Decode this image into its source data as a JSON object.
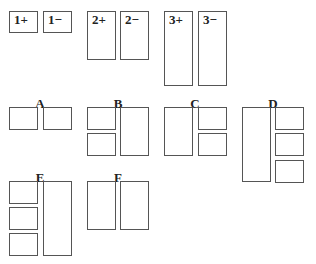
{
  "pieces": [
    {
      "id": "1+",
      "label": "1+",
      "x": 9,
      "y": 11,
      "w": 29,
      "h": 22
    },
    {
      "id": "1-",
      "label": "1−",
      "x": 43,
      "y": 11,
      "w": 29,
      "h": 22
    },
    {
      "id": "2+",
      "label": "2+",
      "x": 87,
      "y": 11,
      "w": 29,
      "h": 49
    },
    {
      "id": "2-",
      "label": "2−",
      "x": 120,
      "y": 11,
      "w": 29,
      "h": 49
    },
    {
      "id": "3+",
      "label": "3+",
      "x": 164,
      "y": 11,
      "w": 29,
      "h": 75
    },
    {
      "id": "3-",
      "label": "3−",
      "x": 198,
      "y": 11,
      "w": 29,
      "h": 75
    }
  ],
  "arrangements": [
    {
      "label": "A",
      "label_x": 30,
      "label_y": 97,
      "boxes": [
        {
          "x": 9,
          "y": 107,
          "w": 29,
          "h": 23
        },
        {
          "x": 43,
          "y": 107,
          "w": 29,
          "h": 23
        }
      ]
    },
    {
      "label": "B",
      "label_x": 108,
      "label_y": 97,
      "boxes": [
        {
          "x": 87,
          "y": 107,
          "w": 29,
          "h": 23
        },
        {
          "x": 87,
          "y": 133,
          "w": 29,
          "h": 23
        },
        {
          "x": 120,
          "y": 107,
          "w": 29,
          "h": 49
        }
      ]
    },
    {
      "label": "C",
      "label_x": 185,
      "label_y": 97,
      "boxes": [
        {
          "x": 164,
          "y": 107,
          "w": 29,
          "h": 49
        },
        {
          "x": 198,
          "y": 107,
          "w": 29,
          "h": 23
        },
        {
          "x": 198,
          "y": 133,
          "w": 29,
          "h": 23
        }
      ]
    },
    {
      "label": "D",
      "label_x": 263,
      "label_y": 97,
      "boxes": [
        {
          "x": 242,
          "y": 107,
          "w": 29,
          "h": 75
        },
        {
          "x": 275,
          "y": 107,
          "w": 29,
          "h": 23
        },
        {
          "x": 275,
          "y": 133,
          "w": 29,
          "h": 23
        },
        {
          "x": 275,
          "y": 160,
          "w": 29,
          "h": 23
        }
      ]
    },
    {
      "label": "E",
      "label_x": 30,
      "label_y": 171,
      "boxes": [
        {
          "x": 9,
          "y": 181,
          "w": 29,
          "h": 23
        },
        {
          "x": 9,
          "y": 207,
          "w": 29,
          "h": 23
        },
        {
          "x": 9,
          "y": 233,
          "w": 29,
          "h": 23
        },
        {
          "x": 43,
          "y": 181,
          "w": 29,
          "h": 75
        }
      ]
    },
    {
      "label": "F",
      "label_x": 108,
      "label_y": 171,
      "boxes": [
        {
          "x": 87,
          "y": 181,
          "w": 29,
          "h": 49
        },
        {
          "x": 120,
          "y": 181,
          "w": 29,
          "h": 49
        }
      ]
    }
  ]
}
